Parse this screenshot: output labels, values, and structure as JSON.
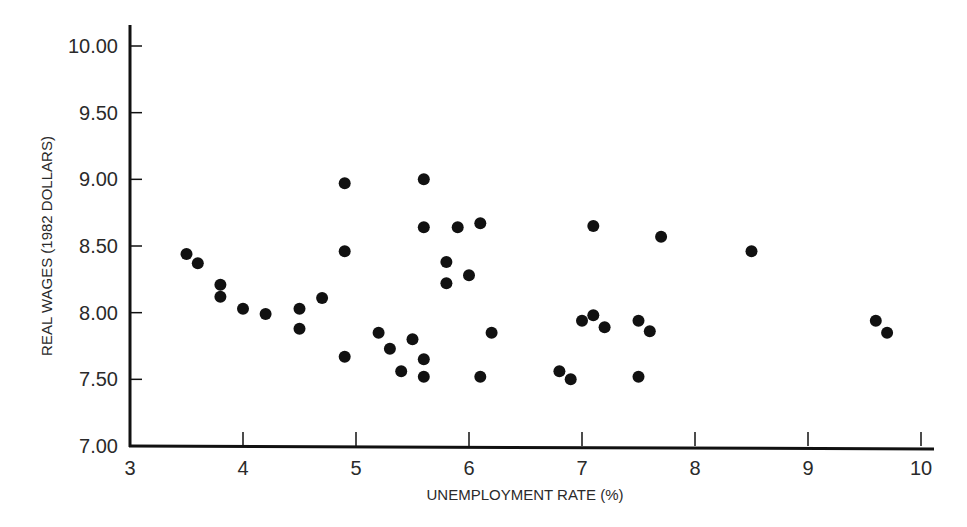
{
  "chart_data": {
    "type": "scatter",
    "title": "",
    "xlabel": "UNEMPLOYMENT RATE (%)",
    "ylabel": "REAL WAGES (1982 DOLLARS)",
    "xlim": [
      3,
      10
    ],
    "ylim": [
      7.0,
      10.0
    ],
    "x_ticks": [
      "3",
      "4",
      "5",
      "6",
      "7",
      "8",
      "9",
      "10"
    ],
    "y_ticks": [
      "7.00",
      "7.50",
      "8.00",
      "8.50",
      "9.00",
      "9.50",
      "10.00"
    ],
    "grid": false,
    "legend": null,
    "marker_color": "#111111",
    "axis_color": "#111111",
    "points": [
      {
        "x": 3.5,
        "y": 8.44
      },
      {
        "x": 3.6,
        "y": 8.37
      },
      {
        "x": 3.8,
        "y": 8.21
      },
      {
        "x": 3.8,
        "y": 8.12
      },
      {
        "x": 4.0,
        "y": 8.03
      },
      {
        "x": 4.2,
        "y": 7.99
      },
      {
        "x": 4.5,
        "y": 8.03
      },
      {
        "x": 4.5,
        "y": 7.88
      },
      {
        "x": 4.7,
        "y": 8.11
      },
      {
        "x": 4.9,
        "y": 8.97
      },
      {
        "x": 4.9,
        "y": 8.46
      },
      {
        "x": 4.9,
        "y": 7.67
      },
      {
        "x": 5.2,
        "y": 7.85
      },
      {
        "x": 5.3,
        "y": 7.73
      },
      {
        "x": 5.4,
        "y": 7.56
      },
      {
        "x": 5.5,
        "y": 7.8
      },
      {
        "x": 5.6,
        "y": 9.0
      },
      {
        "x": 5.6,
        "y": 8.64
      },
      {
        "x": 5.6,
        "y": 7.65
      },
      {
        "x": 5.6,
        "y": 7.52
      },
      {
        "x": 5.8,
        "y": 8.38
      },
      {
        "x": 5.8,
        "y": 8.22
      },
      {
        "x": 5.9,
        "y": 8.64
      },
      {
        "x": 6.0,
        "y": 8.28
      },
      {
        "x": 6.1,
        "y": 8.67
      },
      {
        "x": 6.1,
        "y": 7.52
      },
      {
        "x": 6.2,
        "y": 7.85
      },
      {
        "x": 6.8,
        "y": 7.56
      },
      {
        "x": 6.9,
        "y": 7.5
      },
      {
        "x": 7.0,
        "y": 7.94
      },
      {
        "x": 7.1,
        "y": 8.65
      },
      {
        "x": 7.1,
        "y": 7.98
      },
      {
        "x": 7.2,
        "y": 7.89
      },
      {
        "x": 7.5,
        "y": 7.94
      },
      {
        "x": 7.5,
        "y": 7.52
      },
      {
        "x": 7.6,
        "y": 7.86
      },
      {
        "x": 7.7,
        "y": 8.57
      },
      {
        "x": 8.5,
        "y": 8.46
      },
      {
        "x": 9.6,
        "y": 7.94
      },
      {
        "x": 9.7,
        "y": 7.85
      }
    ]
  }
}
